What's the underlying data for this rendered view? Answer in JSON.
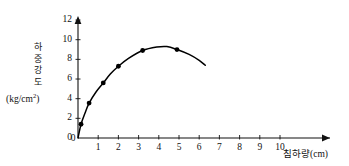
{
  "chart_data": {
    "type": "line",
    "title": "",
    "subtitle": "",
    "xlabel": "침하량(cm)",
    "ylabel": "하중강도",
    "ylabel_unit": "(kg/cm2)",
    "ylabel_unit_base": "(kg/cm",
    "ylabel_unit_sup": "2",
    "ylabel_unit_tail": ")",
    "ylabel_chars": [
      "하",
      "중",
      "강",
      "도"
    ],
    "xlabel_name": "침하량",
    "xlabel_units": "(cm)",
    "x_ticks": [
      "0",
      "1",
      "2",
      "3",
      "4",
      "5",
      "6",
      "7",
      "8",
      "9",
      "10"
    ],
    "x_tick_values": [
      0,
      1,
      2,
      3,
      4,
      5,
      6,
      7,
      8,
      9,
      10
    ],
    "y_ticks": [
      "0",
      "2",
      "4",
      "6",
      "8",
      "10",
      "12"
    ],
    "y_tick_values": [
      0,
      2,
      4,
      6,
      8,
      10,
      12
    ],
    "xlim": [
      0,
      10.6
    ],
    "ylim": [
      0,
      12.4
    ],
    "grid": false,
    "legend": false,
    "series": [
      {
        "name": "하중강도 곡선",
        "marker": "filled-circle",
        "color": "#000000",
        "points": [
          {
            "x": 0.15,
            "y": 1.4
          },
          {
            "x": 0.55,
            "y": 3.55
          },
          {
            "x": 1.25,
            "y": 5.6
          },
          {
            "x": 2.0,
            "y": 7.3
          },
          {
            "x": 3.2,
            "y": 8.9
          },
          {
            "x": 4.9,
            "y": 9.0
          }
        ],
        "curve": [
          {
            "x": 0.0,
            "y": 0.0
          },
          {
            "x": 0.15,
            "y": 1.4
          },
          {
            "x": 0.35,
            "y": 2.55
          },
          {
            "x": 0.55,
            "y": 3.55
          },
          {
            "x": 0.9,
            "y": 4.7
          },
          {
            "x": 1.25,
            "y": 5.6
          },
          {
            "x": 1.6,
            "y": 6.5
          },
          {
            "x": 2.0,
            "y": 7.3
          },
          {
            "x": 2.5,
            "y": 8.1
          },
          {
            "x": 3.2,
            "y": 8.9
          },
          {
            "x": 3.9,
            "y": 9.25
          },
          {
            "x": 4.4,
            "y": 9.3
          },
          {
            "x": 4.9,
            "y": 9.0
          },
          {
            "x": 5.5,
            "y": 8.5
          },
          {
            "x": 6.0,
            "y": 7.9
          },
          {
            "x": 6.3,
            "y": 7.4
          }
        ]
      }
    ],
    "axis_style": {
      "color": "#111111",
      "arrow_x": true,
      "arrow_y": true
    }
  }
}
